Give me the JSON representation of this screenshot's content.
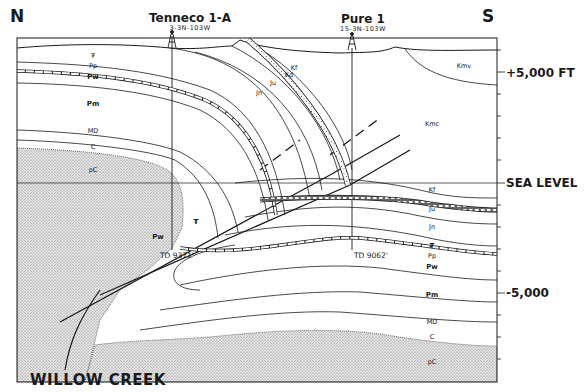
{
  "compass": {
    "north": "N",
    "south": "S"
  },
  "wells": [
    {
      "name": "Tenneco 1-A",
      "location": "3-3N-103W",
      "total_depth": "TD 9371'"
    },
    {
      "name": "Pure 1",
      "location": "15-3N-103W",
      "total_depth": "TD 9062'"
    }
  ],
  "elevation_scale": {
    "plus_5000": "+5,000 FT",
    "sea_level": "SEA LEVEL",
    "minus_5000": "-5,000"
  },
  "fault": {
    "name": "WILLOW CREEK"
  },
  "units_north_block": {
    "tr": "₮",
    "pp": "Pp",
    "pw": "Pw",
    "pm": "Pm",
    "md": "MD",
    "c": "C",
    "pc": "pC"
  },
  "units_fold": {
    "kf": "Kf",
    "kd": "Kd",
    "ju": "Ju",
    "jn": "Jn"
  },
  "units_south_block": {
    "kmv": "Kmv",
    "kmc": "Kmc",
    "kf": "Kf",
    "kd": "Kd",
    "ju": "Ju",
    "jn": "Jn",
    "tr": "₮",
    "pp": "Pp",
    "pw": "Pw",
    "pm": "Pm",
    "md": "MD",
    "c": "C",
    "pc": "pC"
  },
  "units_fault_slivers": {
    "tr": "₮",
    "pw": "Pw"
  },
  "colors": {
    "ink": "#1a1a1a",
    "paper": "#ffffff",
    "stipple": "#9a9a9a"
  }
}
